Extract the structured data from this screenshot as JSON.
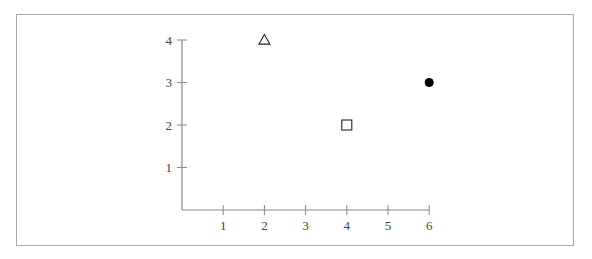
{
  "chart_data": {
    "type": "scatter",
    "title": "",
    "xlabel": "",
    "ylabel": "",
    "xlim": [
      0,
      6
    ],
    "ylim": [
      0,
      4
    ],
    "grid": false,
    "legend": null,
    "x_ticks": [
      1,
      2,
      3,
      4,
      5,
      6
    ],
    "y_ticks": [
      1,
      2,
      3,
      4
    ],
    "x_tick_labels": [
      "1",
      "2",
      "3",
      "4",
      "5",
      "6"
    ],
    "y_tick_labels": [
      "1",
      "2",
      "3",
      "4"
    ],
    "points": [
      {
        "x": 2,
        "y": 4,
        "marker": "open-triangle",
        "color": "#222222"
      },
      {
        "x": 4,
        "y": 2,
        "marker": "open-square",
        "color": "#222222"
      },
      {
        "x": 6,
        "y": 3,
        "marker": "filled-circle",
        "color": "#000000"
      }
    ]
  },
  "style": {
    "axis_color": "#888888",
    "frame_color": "#a8a8a8",
    "label_color": "#444444"
  }
}
